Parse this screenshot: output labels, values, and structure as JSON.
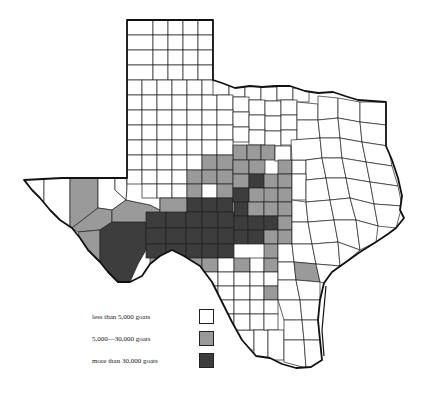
{
  "map": {
    "title": "Texas goat population by county",
    "region": "Texas",
    "colors": {
      "low": "#ffffff",
      "mid": "#9a9a9a",
      "high": "#3d3d3d",
      "border": "#111111"
    }
  },
  "legend": {
    "items": [
      {
        "label": "less than 5,000 goats",
        "color": "#ffffff"
      },
      {
        "label": "5,000—30,000 goats",
        "color": "#9a9a9a"
      },
      {
        "label": "more than 30,000 goats",
        "color": "#3d3d3d"
      }
    ]
  }
}
